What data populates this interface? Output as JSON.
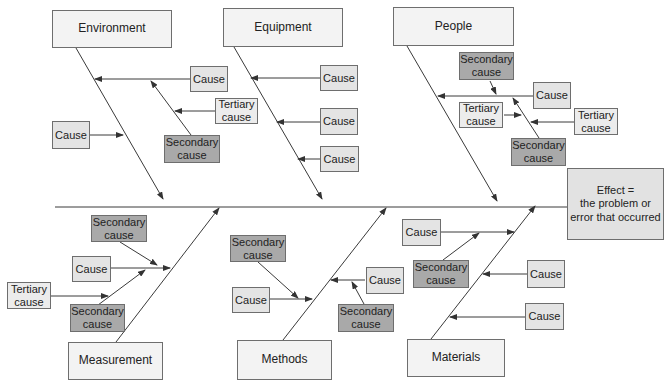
{
  "diagram": {
    "type": "fishbone",
    "effect": {
      "line1": "Effect =",
      "line2": "the problem or",
      "line3": "error that occurred"
    },
    "top_categories": [
      {
        "label": "Environment",
        "causes": [
          {
            "label": "Cause",
            "type": "cause"
          },
          {
            "label": "Tertiary cause",
            "type": "tertiary"
          },
          {
            "label": "Secondary cause",
            "type": "secondary"
          },
          {
            "label": "Cause",
            "type": "cause"
          }
        ]
      },
      {
        "label": "Equipment",
        "causes": [
          {
            "label": "Cause",
            "type": "cause"
          },
          {
            "label": "Cause",
            "type": "cause"
          },
          {
            "label": "Cause",
            "type": "cause"
          }
        ]
      },
      {
        "label": "People",
        "causes": [
          {
            "label": "Secondary cause",
            "type": "secondary"
          },
          {
            "label": "Cause",
            "type": "cause"
          },
          {
            "label": "Tertiary cause",
            "type": "tertiary"
          },
          {
            "label": "Tertiary cause",
            "type": "tertiary"
          },
          {
            "label": "Secondary cause",
            "type": "secondary"
          }
        ]
      }
    ],
    "bottom_categories": [
      {
        "label": "Measurement",
        "causes": [
          {
            "label": "Secondary cause",
            "type": "secondary"
          },
          {
            "label": "Cause",
            "type": "cause"
          },
          {
            "label": "Tertiary cause",
            "type": "tertiary"
          },
          {
            "label": "Secondary cause",
            "type": "secondary"
          }
        ]
      },
      {
        "label": "Methods",
        "causes": [
          {
            "label": "Secondary cause",
            "type": "secondary"
          },
          {
            "label": "Cause",
            "type": "cause"
          },
          {
            "label": "Cause",
            "type": "cause"
          },
          {
            "label": "Secondary cause",
            "type": "secondary"
          }
        ]
      },
      {
        "label": "Materials",
        "causes": [
          {
            "label": "Cause",
            "type": "cause"
          },
          {
            "label": "Secondary cause",
            "type": "secondary"
          },
          {
            "label": "Cause",
            "type": "cause"
          },
          {
            "label": "Cause",
            "type": "cause"
          }
        ]
      }
    ],
    "labels": {
      "cause": "Cause",
      "secondary_l1": "Secondary",
      "secondary_l2": "cause",
      "tertiary_l1": "Tertiary",
      "tertiary_l2": "cause"
    },
    "colors": {
      "line": "#3a3a3a",
      "category_fill": "#f3f3f3",
      "cause_fill": "#e4e4e4",
      "secondary_fill": "#a9a9a9",
      "effect_fill": "#e2e2e2"
    }
  }
}
